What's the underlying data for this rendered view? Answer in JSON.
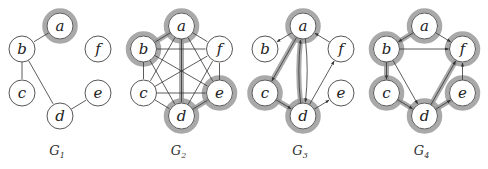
{
  "figure": {
    "panel_offset": 121.5,
    "node_radius": 13,
    "highlight_color": "#9a9a9a",
    "edge_color": "#333333",
    "node_positions": {
      "a": [
        60,
        26
      ],
      "b": [
        22,
        49
      ],
      "c": [
        22,
        93
      ],
      "d": [
        60,
        116
      ],
      "e": [
        98,
        93
      ],
      "f": [
        98,
        49
      ]
    },
    "graphs": [
      {
        "id": "G1",
        "title": "G",
        "subscript": "1",
        "directed": false,
        "highlighted_nodes": [
          "a"
        ],
        "edges": [
          {
            "from": "a",
            "to": "b"
          },
          {
            "from": "b",
            "to": "c"
          },
          {
            "from": "b",
            "to": "d"
          },
          {
            "from": "d",
            "to": "e"
          }
        ],
        "highlighted_edges": []
      },
      {
        "id": "G2",
        "title": "G",
        "subscript": "2",
        "directed": false,
        "highlighted_nodes": [
          "a",
          "b",
          "d",
          "e"
        ],
        "edges": [
          {
            "from": "a",
            "to": "b"
          },
          {
            "from": "a",
            "to": "c"
          },
          {
            "from": "a",
            "to": "d"
          },
          {
            "from": "a",
            "to": "e"
          },
          {
            "from": "a",
            "to": "f"
          },
          {
            "from": "b",
            "to": "c"
          },
          {
            "from": "b",
            "to": "d"
          },
          {
            "from": "b",
            "to": "e"
          },
          {
            "from": "b",
            "to": "f"
          },
          {
            "from": "c",
            "to": "d"
          },
          {
            "from": "c",
            "to": "e"
          },
          {
            "from": "c",
            "to": "f"
          },
          {
            "from": "d",
            "to": "e"
          },
          {
            "from": "d",
            "to": "f"
          },
          {
            "from": "e",
            "to": "f"
          }
        ],
        "highlighted_edges": [
          {
            "from": "a",
            "to": "b"
          },
          {
            "from": "a",
            "to": "d"
          },
          {
            "from": "d",
            "to": "e"
          }
        ]
      },
      {
        "id": "G3",
        "title": "G",
        "subscript": "3",
        "directed": true,
        "highlighted_nodes": [
          "a",
          "c",
          "d"
        ],
        "edges": [
          {
            "from": "a",
            "to": "b"
          },
          {
            "from": "a",
            "to": "c"
          },
          {
            "from": "a",
            "to": "d",
            "curve": -6
          },
          {
            "from": "d",
            "to": "a",
            "curve": -6
          },
          {
            "from": "c",
            "to": "d"
          },
          {
            "from": "d",
            "to": "e"
          },
          {
            "from": "d",
            "to": "f"
          },
          {
            "from": "f",
            "to": "a"
          }
        ],
        "highlighted_edges": [
          {
            "from": "a",
            "to": "c"
          },
          {
            "from": "c",
            "to": "d"
          },
          {
            "from": "d",
            "to": "a"
          }
        ]
      },
      {
        "id": "G4",
        "title": "G",
        "subscript": "4",
        "directed": true,
        "highlighted_nodes": [
          "a",
          "b",
          "c",
          "d",
          "e",
          "f"
        ],
        "edges": [
          {
            "from": "a",
            "to": "b"
          },
          {
            "from": "a",
            "to": "f"
          },
          {
            "from": "b",
            "to": "f"
          },
          {
            "from": "b",
            "to": "c"
          },
          {
            "from": "b",
            "to": "d"
          },
          {
            "from": "c",
            "to": "d"
          },
          {
            "from": "d",
            "to": "e"
          },
          {
            "from": "d",
            "to": "f"
          },
          {
            "from": "e",
            "to": "f"
          }
        ],
        "highlighted_edges": [
          {
            "from": "a",
            "to": "b"
          },
          {
            "from": "b",
            "to": "c"
          },
          {
            "from": "c",
            "to": "d"
          },
          {
            "from": "d",
            "to": "e"
          },
          {
            "from": "d",
            "to": "f"
          }
        ]
      }
    ]
  }
}
